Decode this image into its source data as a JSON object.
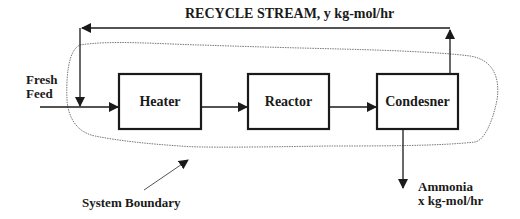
{
  "diagram": {
    "recycle_label": "RECYCLE STREAM, y kg-mol/hr",
    "fresh_feed_label": [
      "Fresh",
      "Feed"
    ],
    "units": [
      {
        "id": "heater",
        "label": "Heater"
      },
      {
        "id": "reactor",
        "label": "Reactor"
      },
      {
        "id": "condenser",
        "label": "Condesner"
      }
    ],
    "system_boundary_label": "System Boundary",
    "product_label": [
      "Ammonia",
      "x kg-mol/hr"
    ],
    "colors": {
      "line": "#1a1a1a",
      "boundary": "#777777",
      "background": "#ffffff"
    }
  }
}
